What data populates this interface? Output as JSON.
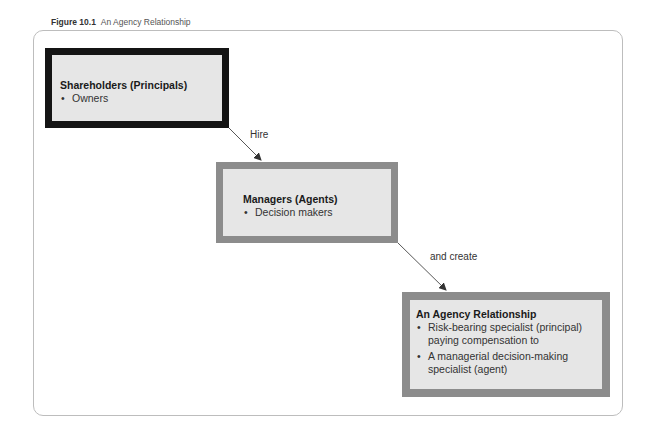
{
  "caption": {
    "figure_number": "Figure 10.1",
    "title": "An Agency Relationship"
  },
  "boxes": [
    {
      "title": "Shareholders (Principals)",
      "bullets": [
        "Owners"
      ],
      "border_color": "#141414"
    },
    {
      "title": "Managers (Agents)",
      "bullets": [
        "Decision makers"
      ],
      "border_color": "#8c8c8c"
    },
    {
      "title": "An Agency Relationship",
      "bullets": [
        "Risk-bearing specialist (principal) paying compensation to",
        "A managerial decision-making specialist (agent)"
      ],
      "border_color": "#8c8c8c"
    }
  ],
  "arrows": [
    {
      "from": "Shareholders (Principals)",
      "to": "Managers (Agents)",
      "label": "Hire"
    },
    {
      "from": "Managers (Agents)",
      "to": "An Agency Relationship",
      "label": "and create"
    }
  ],
  "colors": {
    "box_fill": "#e6e6e6",
    "frame": "#bdbdbd"
  }
}
